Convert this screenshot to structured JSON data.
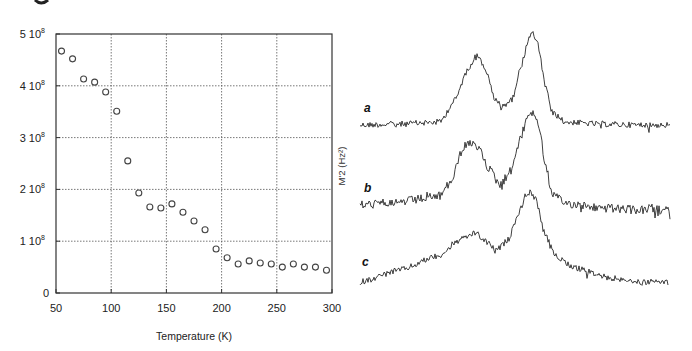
{
  "chart_data": [
    {
      "type": "scatter",
      "title": "",
      "xlabel": "Temperature (K)",
      "ylabel": "",
      "xlim": [
        50,
        300
      ],
      "ylim": [
        0,
        500000000
      ],
      "grid": true,
      "x_ticks": [
        50,
        100,
        150,
        200,
        250,
        300
      ],
      "x_tick_labels": [
        "50",
        "100",
        "150",
        "200",
        "250",
        "300"
      ],
      "y_ticks": [
        0,
        100000000,
        200000000,
        300000000,
        400000000,
        500000000
      ],
      "y_tick_labels": [
        {
          "mant": "0",
          "exp": ""
        },
        {
          "mant": "1 10",
          "exp": "8"
        },
        {
          "mant": "2 10",
          "exp": "8"
        },
        {
          "mant": "3 10",
          "exp": "8"
        },
        {
          "mant": "4 10",
          "exp": "8"
        },
        {
          "mant": "5 10",
          "exp": "8"
        }
      ],
      "marker": "open-circle",
      "series": [
        {
          "name": "M2",
          "x": [
            55,
            65,
            75,
            85,
            95,
            105,
            115,
            125,
            135,
            145,
            155,
            165,
            175,
            185,
            195,
            205,
            215,
            225,
            235,
            245,
            255,
            265,
            275,
            285,
            295
          ],
          "y": [
            467000000.0,
            452000000.0,
            413000000.0,
            407000000.0,
            388000000.0,
            351000000.0,
            255000000.0,
            193000000.0,
            166000000.0,
            164000000.0,
            172000000.0,
            156000000.0,
            139000000.0,
            122000000.0,
            85000000.0,
            68000000.0,
            56000000.0,
            62000000.0,
            58000000.0,
            56000000.0,
            50000000.0,
            56000000.0,
            50000000.0,
            50000000.0,
            44000000.0
          ]
        }
      ]
    },
    {
      "type": "line",
      "title": "",
      "xlabel": "",
      "ylabel": "M'2 (Hz²)",
      "grid": false,
      "description": "Three vertically offset noisy spectra labeled a, b, c, each showing two peaks (left broad, right sharper)",
      "series": [
        {
          "name": "a",
          "control_points": [
            [
              360,
              125
            ],
            [
              400,
              124
            ],
            [
              440,
              122
            ],
            [
              455,
              100
            ],
            [
              468,
              68
            ],
            [
              477,
              55
            ],
            [
              485,
              68
            ],
            [
              495,
              100
            ],
            [
              502,
              106
            ],
            [
              512,
              100
            ],
            [
              520,
              70
            ],
            [
              528,
              40
            ],
            [
              532,
              32
            ],
            [
              538,
              45
            ],
            [
              545,
              85
            ],
            [
              552,
              112
            ],
            [
              565,
              122
            ],
            [
              600,
              124
            ],
            [
              640,
              125
            ],
            [
              670,
              125
            ]
          ],
          "noise": 3.0
        },
        {
          "name": "b",
          "control_points": [
            [
              360,
              205
            ],
            [
              400,
              202
            ],
            [
              440,
              196
            ],
            [
              452,
              180
            ],
            [
              462,
              150
            ],
            [
              468,
              143
            ],
            [
              478,
              148
            ],
            [
              490,
              170
            ],
            [
              500,
              185
            ],
            [
              510,
              172
            ],
            [
              520,
              140
            ],
            [
              528,
              115
            ],
            [
              532,
              112
            ],
            [
              538,
              122
            ],
            [
              545,
              160
            ],
            [
              552,
              195
            ],
            [
              565,
              203
            ],
            [
              600,
              208
            ],
            [
              640,
              210
            ],
            [
              670,
              210
            ]
          ],
          "noise": 4.5
        },
        {
          "name": "c",
          "control_points": [
            [
              360,
              282
            ],
            [
              400,
              270
            ],
            [
              440,
              255
            ],
            [
              460,
              240
            ],
            [
              475,
              233
            ],
            [
              488,
              243
            ],
            [
              497,
              250
            ],
            [
              508,
              240
            ],
            [
              518,
              215
            ],
            [
              526,
              195
            ],
            [
              530,
              192
            ],
            [
              536,
              200
            ],
            [
              545,
              235
            ],
            [
              555,
              255
            ],
            [
              575,
              268
            ],
            [
              610,
              278
            ],
            [
              640,
              282
            ],
            [
              668,
              282
            ]
          ],
          "noise": 3.0
        }
      ],
      "labels": [
        {
          "text": "a",
          "x": 364,
          "y": 112
        },
        {
          "text": "b",
          "x": 364,
          "y": 192
        },
        {
          "text": "c",
          "x": 362,
          "y": 266
        }
      ]
    }
  ],
  "left_panel": {
    "xlabel": "Temperature (K)"
  },
  "right_panel": {
    "ylabel": "M'2 (Hz²)",
    "spectrum_labels": [
      "a",
      "b",
      "c"
    ]
  },
  "colors": {
    "axis": "#333333",
    "grid": "#555555",
    "marker": "#444444",
    "trace": "#2a2a2a"
  }
}
